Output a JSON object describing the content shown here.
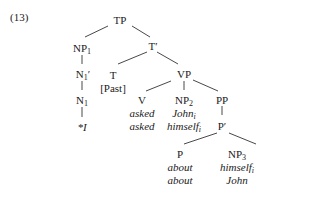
{
  "example_number": "(13)",
  "tree": {
    "TP": "TP",
    "NP1": {
      "base": "NP",
      "sub": "1"
    },
    "N1bar": {
      "base": "N",
      "sub": "1",
      "sup": "′"
    },
    "N1": {
      "base": "N",
      "sub": "1"
    },
    "N1_leaf": "*I",
    "Tbar": "T′",
    "T": "T",
    "T_feature": "[Past]",
    "VP": "VP",
    "V": "V",
    "V_leaf1": "asked",
    "V_leaf2": "asked",
    "NP2": {
      "base": "NP",
      "sub": "2"
    },
    "NP2_leaf1": {
      "text": "John",
      "sub": "i"
    },
    "NP2_leaf2": {
      "text": "himself",
      "sub": "i"
    },
    "PP": "PP",
    "Pbar": "P′",
    "P": "P",
    "P_leaf1": "about",
    "P_leaf2": "about",
    "NP3": {
      "base": "NP",
      "sub": "3"
    },
    "NP3_leaf1": {
      "text": "himself",
      "sub": "i"
    },
    "NP3_leaf2": "John"
  }
}
